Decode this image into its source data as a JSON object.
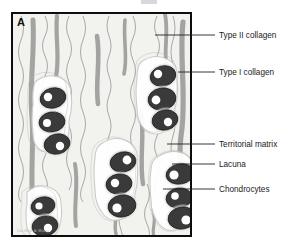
{
  "figure": {
    "panel_letter": "A",
    "signature": "Ida Kim & Marie"
  },
  "colors": {
    "background": "#ffffff",
    "panel_fill": "#f2f2ef",
    "panel_border": "#0d0d0d",
    "type_i_collagen": "#9a9a98",
    "type_ii_collagen": "#8c8c8a",
    "chondrocyte_body": "#3a3a3a",
    "chondrocyte_nucleus": "#ffffff",
    "lacuna_ring": "#ffffff",
    "territorial_matrix": "#c9c9c6",
    "leader_line": "#222222",
    "label_text": "#1a1a1a"
  },
  "labels": [
    {
      "id": "type-ii-collagen",
      "text": "Type II collagen",
      "text_x": 219,
      "text_y": 31,
      "line_x1": 155,
      "line_y1": 35,
      "line_x2": 215,
      "line_y2": 35
    },
    {
      "id": "type-i-collagen",
      "text": "Type I collagen",
      "text_x": 219,
      "text_y": 68,
      "line_x1": 178,
      "line_y1": 72,
      "line_x2": 215,
      "line_y2": 72
    },
    {
      "id": "territorial-matrix",
      "text": "Territorial matrix",
      "text_x": 219,
      "text_y": 140,
      "line_x1": 167,
      "line_y1": 144,
      "line_x2": 215,
      "line_y2": 144
    },
    {
      "id": "lacuna",
      "text": "Lacuna",
      "text_x": 219,
      "text_y": 160,
      "line_x1": 172,
      "line_y1": 164,
      "line_x2": 215,
      "line_y2": 164
    },
    {
      "id": "chondrocytes",
      "text": "Chondrocytes",
      "text_x": 219,
      "text_y": 185,
      "line_x1": 163,
      "line_y1": 189,
      "line_x2": 215,
      "line_y2": 189
    }
  ],
  "type_i_collagen_fibers": [
    {
      "d": "M 20,6 C 22,40 16,70 19,104 C 21,132 17,160 20,196",
      "w": 5.0
    },
    {
      "d": "M 44,2 C 42,22 47,44 43,62",
      "w": 4.2
    },
    {
      "d": "M 84,22 C 88,46 82,66 85,90",
      "w": 4.6
    },
    {
      "d": "M 112,6 C 110,26 115,44 111,60",
      "w": 3.6
    },
    {
      "d": "M 128,100 C 132,122 126,146 130,170",
      "w": 4.4
    },
    {
      "d": "M 152,0 C 156,20 150,38 154,56",
      "w": 3.8
    },
    {
      "d": "M 170,8 C 166,44 174,84 168,122 C 164,150 172,178 167,206",
      "w": 5.2
    },
    {
      "d": "M 62,150 C 66,172 60,192 63,212",
      "w": 4.0
    },
    {
      "d": "M 102,186 C 106,200 100,210 103,220",
      "w": 3.4
    },
    {
      "d": "M 140,196 C 144,208 138,216 141,222",
      "w": 3.2
    }
  ],
  "type_ii_collagen_fibers": [
    {
      "d": "M 32,2 q 5,10 0,20 q -5,10 0,20 q 5,10 0,20 q -5,10 0,20 q 5,10 0,20 q -5,10 0,20 q 5,10 0,20 q -5,10 0,20 q 5,10 0,20 q -5,10 0,18"
    },
    {
      "d": "M 56,2 q -5,11 0,22 q 5,11 0,22 q -5,11 0,22 q 5,11 0,22 q -5,11 0,22 q 5,11 0,22 q -5,11 0,22 q 5,11 0,20"
    },
    {
      "d": "M 70,2 q 5,12 0,24 q -5,12 0,24 q 5,12 0,24 q -5,12 0,24 q 5,12 0,24 q -5,12 0,24 q 5,12 0,24 q -5,12 0,18"
    },
    {
      "d": "M 96,2 q -4,10 0,20 q 4,10 0,20 q -4,10 0,20 q 4,10 0,20 q -4,10 0,20 q 4,10 0,20 q -4,10 0,20 q 4,10 0,20 q -4,10 0,18"
    },
    {
      "d": "M 120,2 q 5,11 0,22 q -5,11 0,22 q 5,11 0,22 q -5,11 0,22 q 5,11 0,22 q -5,11 0,22 q 5,11 0,22 q -5,11 0,20"
    },
    {
      "d": "M 144,2 q -5,10 0,20 q 5,10 0,20 q -5,10 0,20 q 5,10 0,20 q -5,10 0,20 q 5,10 0,20 q -5,10 0,20 q 5,10 0,20 q -5,10 0,18"
    },
    {
      "d": "M 160,2 q 4,12 0,24 q -4,12 0,24 q 4,12 0,24 q -4,12 0,24 q 4,12 0,24 q -4,12 0,24 q 4,12 0,24 q -4,12 0,18"
    },
    {
      "d": "M 8,2 q 5,12 0,24 q -5,12 0,24 q 5,12 0,24 q -5,12 0,24 q 5,12 0,24 q -5,12 0,24 q 5,12 0,24 q -5,12 0,18"
    },
    {
      "d": "M 108,150 q -4,11 0,22 q 4,11 0,22 q -4,11 0,22 q 4,11 0,18"
    },
    {
      "d": "M 134,170 q 5,10 0,20 q -5,10 0,20 q 5,10 0,18"
    }
  ],
  "cell_clusters": [
    {
      "id": "cluster-left-upper",
      "matrix_path": "M 22,68 q 12,-10 26,-4 q 10,4 10,16 q 2,14 -2,26 q 1,16 -4,26 q -8,10 -20,6 q -12,-4 -12,-18 q -2,-16 0,-30 q -1,-14 2,-22 Z",
      "cells": [
        {
          "cx": 40,
          "cy": 84,
          "rx": 13,
          "ry": 10,
          "rot": -14,
          "nx": -5,
          "ny": -1,
          "nr": 4.2
        },
        {
          "cx": 39,
          "cy": 108,
          "rx": 13,
          "ry": 10,
          "rot": -8,
          "nx": -5,
          "ny": 1,
          "nr": 4.0
        },
        {
          "cx": 44,
          "cy": 130,
          "rx": 13,
          "ry": 10,
          "rot": -12,
          "nx": 3,
          "ny": 2,
          "nr": 4.2
        }
      ]
    },
    {
      "id": "cluster-right-upper",
      "matrix_path": "M 128,48 q 14,-10 28,-2 q 10,6 8,20 q 2,16 -2,28 q 0,16 -8,22 q -12,8 -22,0 q -8,-8 -8,-22 q -2,-18 0,-30 q 0,-12 4,-16 Z",
      "cells": [
        {
          "cx": 150,
          "cy": 62,
          "rx": 13,
          "ry": 10,
          "rot": -16,
          "nx": -5,
          "ny": -2,
          "nr": 4.2
        },
        {
          "cx": 149,
          "cy": 85,
          "rx": 14,
          "ry": 11,
          "rot": -10,
          "nx": -6,
          "ny": 1,
          "nr": 4.4
        },
        {
          "cx": 152,
          "cy": 106,
          "rx": 13,
          "ry": 10,
          "rot": -12,
          "nx": 3,
          "ny": 2,
          "nr": 4.2
        }
      ]
    },
    {
      "id": "cluster-center-lower",
      "matrix_path": "M 88,130 q 14,-10 28,-2 q 10,6 8,20 q 2,18 -2,32 q 0,18 -10,24 q -14,6 -22,-4 q -8,-10 -8,-24 q -2,-20 0,-32 q 0,-10 6,-14 Z",
      "cells": [
        {
          "cx": 110,
          "cy": 148,
          "rx": 13,
          "ry": 10,
          "rot": -12,
          "nx": 4,
          "ny": -2,
          "nr": 4.4
        },
        {
          "cx": 106,
          "cy": 170,
          "rx": 13,
          "ry": 10,
          "rot": -8,
          "nx": -4,
          "ny": -1,
          "nr": 4.2
        },
        {
          "cx": 109,
          "cy": 192,
          "rx": 14,
          "ry": 11,
          "rot": -10,
          "nx": -5,
          "ny": 2,
          "nr": 4.6
        }
      ]
    },
    {
      "id": "cluster-right-lower",
      "matrix_path": "M 146,142 q 14,-8 26,-2 q 10,6 8,20 q 2,18 -2,32 q 0,16 -10,22 q -14,6 -22,-4 q -8,-10 -8,-24 q -2,-20 0,-30 q 0,-10 8,-14 Z",
      "cells": [
        {
          "cx": 167,
          "cy": 160,
          "rx": 14,
          "ry": 10,
          "rot": -10,
          "nx": -6,
          "ny": 1,
          "nr": 4.6
        },
        {
          "cx": 166,
          "cy": 184,
          "rx": 13,
          "ry": 10,
          "rot": -8,
          "nx": -4,
          "ny": -2,
          "nr": 3.8
        },
        {
          "cx": 169,
          "cy": 204,
          "rx": 14,
          "ry": 11,
          "rot": -10,
          "nx": 4,
          "ny": 2,
          "nr": 4.6
        }
      ]
    },
    {
      "id": "cluster-left-lower",
      "matrix_path": "M 14,178 q 12,-10 24,-4 q 10,4 10,16 q 2,14 -2,24 q -4,12 -16,12 q -12,0 -16,-12 q -2,-14 0,-24 q 0,-8 0,-12 Z",
      "cells": [
        {
          "cx": 30,
          "cy": 192,
          "rx": 12,
          "ry": 9,
          "rot": -12,
          "nx": -4,
          "ny": 0,
          "nr": 3.6
        },
        {
          "cx": 32,
          "cy": 212,
          "rx": 13,
          "ry": 10,
          "rot": -10,
          "nx": 3,
          "ny": 2,
          "nr": 4.2
        }
      ]
    }
  ]
}
